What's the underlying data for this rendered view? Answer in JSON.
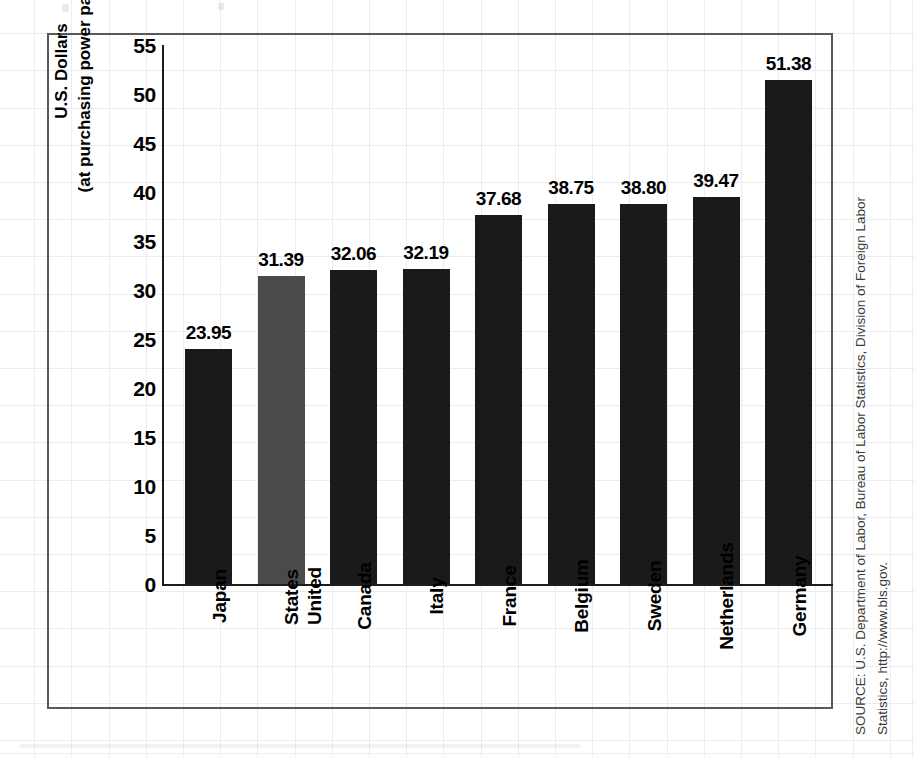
{
  "chart_data": {
    "type": "bar",
    "title": "",
    "xlabel": "",
    "ylabel_lines": [
      "U.S. Dollars",
      "(at purchasing power parities)"
    ],
    "ylim": [
      0,
      55
    ],
    "ytick_step": 5,
    "yticks": [
      "55",
      "50",
      "45",
      "40",
      "35",
      "30",
      "25",
      "20",
      "15",
      "10",
      "5",
      "0"
    ],
    "grid": true,
    "legend": "none",
    "highlight_category": "United States",
    "colors": {
      "bar": "#1a1a1a",
      "bar_highlight": "#4a4a4a",
      "frame": "#58595b",
      "grid": "#d9dde3",
      "axis": "#1d1d1d"
    },
    "categories": [
      "Japan",
      "United States",
      "Canada",
      "Italy",
      "France",
      "Belgium",
      "Sweden",
      "Netherlands",
      "Germany"
    ],
    "category_lines": [
      [
        "Japan"
      ],
      [
        "United",
        "States"
      ],
      [
        "Canada"
      ],
      [
        "Italy"
      ],
      [
        "France"
      ],
      [
        "Belgium"
      ],
      [
        "Sweden"
      ],
      [
        "Netherlands"
      ],
      [
        "Germany"
      ]
    ],
    "values": [
      23.95,
      31.39,
      32.06,
      32.19,
      37.68,
      38.75,
      38.8,
      39.47,
      51.38
    ],
    "value_labels": [
      "23.95",
      "31.39",
      "32.06",
      "32.19",
      "37.68",
      "38.75",
      "38.80",
      "39.47",
      "51.38"
    ]
  },
  "source": {
    "line1": "SOURCE: U.S. Department of Labor, Bureau of Labor Statistics, Division of Foreign Labor",
    "line2": "Statistics, http://www.bls.gov."
  }
}
